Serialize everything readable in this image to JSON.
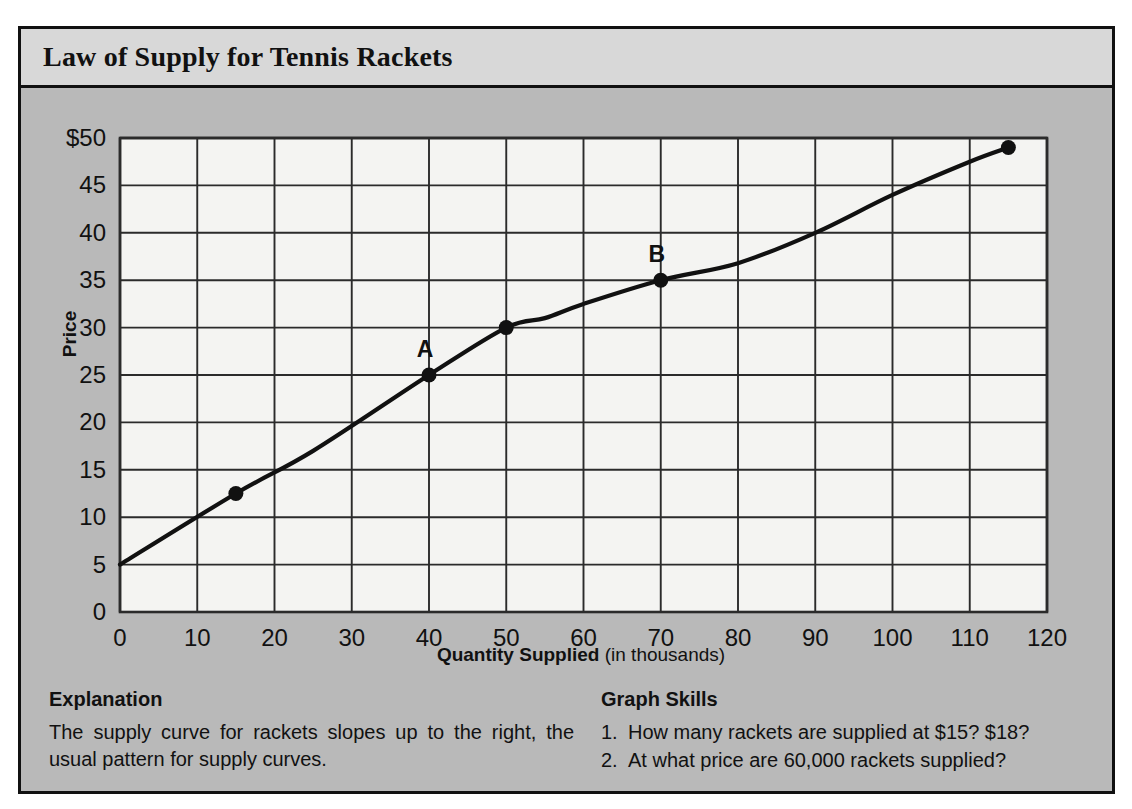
{
  "figure": {
    "title": "Law of Supply for Tennis Rackets"
  },
  "explanation": {
    "heading": "Explanation",
    "body": "The supply curve for rackets slopes up to the right, the usual pattern for supply curves."
  },
  "skills": {
    "heading": "Graph Skills",
    "items": [
      {
        "num": "1.",
        "text": "How many rackets are supplied at $15? $18?"
      },
      {
        "num": "2.",
        "text": "At what price are 60,000 rackets supplied?"
      }
    ]
  },
  "colors": {
    "paper": "#ffffff",
    "figure_background": "#b9b9b9",
    "title_background": "#d8d8d8",
    "plot_background": "#f4f4f2",
    "ink": "#111111",
    "grid": "#2b2b2b"
  },
  "chart_data": {
    "type": "line",
    "title": "Law of Supply for Tennis Rackets",
    "xlabel": "Quantity Supplied (in thousands)",
    "ylabel": "Price",
    "xlim": [
      0,
      120
    ],
    "ylim": [
      0,
      50
    ],
    "grid": true,
    "legend": "none",
    "xticks": [
      0,
      10,
      20,
      30,
      40,
      50,
      60,
      70,
      80,
      90,
      100,
      110,
      120
    ],
    "xticklabels": [
      "0",
      "10",
      "20",
      "30",
      "40",
      "50",
      "60",
      "70",
      "80",
      "90",
      "100",
      "110",
      "120"
    ],
    "yticks": [
      0,
      5,
      10,
      15,
      20,
      25,
      30,
      35,
      40,
      45,
      50
    ],
    "yticklabels": [
      "0",
      "5",
      "10",
      "15",
      "20",
      "25",
      "30",
      "35",
      "40",
      "45",
      "$50"
    ],
    "series": [
      {
        "name": "Supply curve",
        "x": [
          0,
          15,
          25,
          40,
          50,
          55,
          60,
          70,
          80,
          90,
          100,
          110,
          115
        ],
        "y": [
          5,
          12.5,
          17,
          25,
          30,
          31,
          32.5,
          35,
          36.8,
          40,
          44,
          47.5,
          49
        ]
      }
    ],
    "markers": [
      {
        "label": "",
        "x": 15,
        "y": 12.5
      },
      {
        "label": "A",
        "x": 40,
        "y": 25
      },
      {
        "label": "",
        "x": 50,
        "y": 30
      },
      {
        "label": "B",
        "x": 70,
        "y": 35
      },
      {
        "label": "",
        "x": 115,
        "y": 49
      }
    ]
  }
}
